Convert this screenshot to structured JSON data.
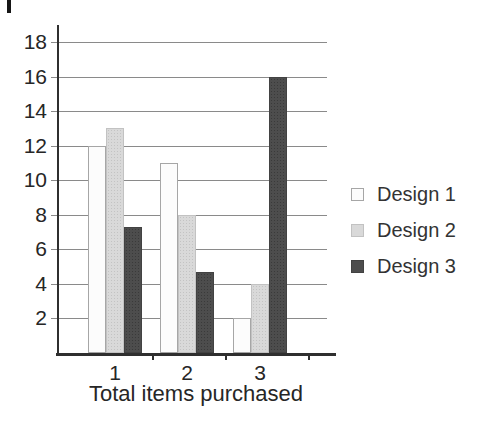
{
  "chart_data": {
    "type": "bar",
    "title": "",
    "xlabel": "Total items purchased",
    "ylabel": "",
    "categories": [
      "1",
      "2",
      "3"
    ],
    "series": [
      {
        "name": "Design 1",
        "values": [
          12,
          11,
          2
        ],
        "color": "#fcfcfc",
        "border": "#a6a6a6"
      },
      {
        "name": "Design 2",
        "values": [
          13,
          8,
          4
        ],
        "color": "#d9d9d9",
        "border": "#c2c2c2"
      },
      {
        "name": "Design 3",
        "values": [
          7.3,
          4.7,
          16
        ],
        "color": "#4d4d4d",
        "border": "#424242"
      }
    ],
    "yticks": [
      2,
      4,
      6,
      8,
      10,
      12,
      14,
      16,
      18
    ],
    "ylim": [
      0,
      19
    ],
    "grid": true,
    "legend_position": "right"
  },
  "colors": {
    "background": "#ffffff",
    "axis": "#2f2f2f",
    "gridline": "#8a8a8a",
    "text": "#262626"
  }
}
